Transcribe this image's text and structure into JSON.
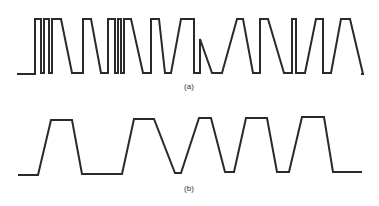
{
  "figure": {
    "width": 379,
    "height": 206,
    "stroke_color": "#2a2a2a",
    "background": "#ffffff"
  },
  "waveforms": [
    {
      "id": "a",
      "label": "(a)",
      "label_x": 189,
      "label_y": 82,
      "stroke_width": 2,
      "description": "Sharp-edged digital pulse train with narrow and wide pulses and fast transitions",
      "points": [
        [
          17,
          74
        ],
        [
          35,
          74
        ],
        [
          35,
          19
        ],
        [
          41,
          19
        ],
        [
          41,
          73
        ],
        [
          44,
          73
        ],
        [
          44,
          19
        ],
        [
          49,
          19
        ],
        [
          49,
          73
        ],
        [
          52,
          73
        ],
        [
          52,
          19
        ],
        [
          61,
          19
        ],
        [
          72,
          73
        ],
        [
          83,
          73
        ],
        [
          83,
          19
        ],
        [
          91,
          19
        ],
        [
          101,
          73
        ],
        [
          108,
          73
        ],
        [
          108,
          19
        ],
        [
          115,
          19
        ],
        [
          115,
          73
        ],
        [
          118,
          73
        ],
        [
          118,
          19
        ],
        [
          121,
          19
        ],
        [
          121,
          73
        ],
        [
          124,
          73
        ],
        [
          124,
          19
        ],
        [
          131,
          19
        ],
        [
          143,
          73
        ],
        [
          151,
          73
        ],
        [
          151,
          19
        ],
        [
          159,
          19
        ],
        [
          165,
          73
        ],
        [
          171,
          73
        ],
        [
          181,
          19
        ],
        [
          194,
          19
        ],
        [
          194,
          73
        ],
        [
          200,
          73
        ],
        [
          200,
          39
        ],
        [
          212,
          73
        ],
        [
          222,
          73
        ],
        [
          237,
          19
        ],
        [
          243,
          19
        ],
        [
          253,
          73
        ],
        [
          260,
          73
        ],
        [
          260,
          19
        ],
        [
          268,
          19
        ],
        [
          284,
          73
        ],
        [
          292,
          73
        ],
        [
          292,
          19
        ],
        [
          296,
          19
        ],
        [
          296,
          73
        ],
        [
          305,
          73
        ],
        [
          316,
          19
        ],
        [
          323,
          19
        ],
        [
          323,
          73
        ],
        [
          331,
          73
        ],
        [
          341,
          19
        ],
        [
          350,
          19
        ],
        [
          363,
          74
        ],
        [
          361,
          74
        ]
      ]
    },
    {
      "id": "b",
      "label": "(b)",
      "label_x": 189,
      "label_y": 184,
      "stroke_width": 2,
      "description": "Smoothed trapezoidal waveform with slow rise and fall transitions",
      "points": [
        [
          18,
          175
        ],
        [
          38,
          175
        ],
        [
          51,
          120
        ],
        [
          72,
          120
        ],
        [
          82,
          174
        ],
        [
          122,
          174
        ],
        [
          134,
          119
        ],
        [
          154,
          119
        ],
        [
          175,
          173
        ],
        [
          181,
          173
        ],
        [
          199,
          118
        ],
        [
          211,
          118
        ],
        [
          225,
          172
        ],
        [
          234,
          172
        ],
        [
          246,
          118
        ],
        [
          267,
          118
        ],
        [
          277,
          172
        ],
        [
          289,
          172
        ],
        [
          302,
          117
        ],
        [
          324,
          117
        ],
        [
          333,
          172
        ],
        [
          362,
          172
        ]
      ]
    }
  ]
}
